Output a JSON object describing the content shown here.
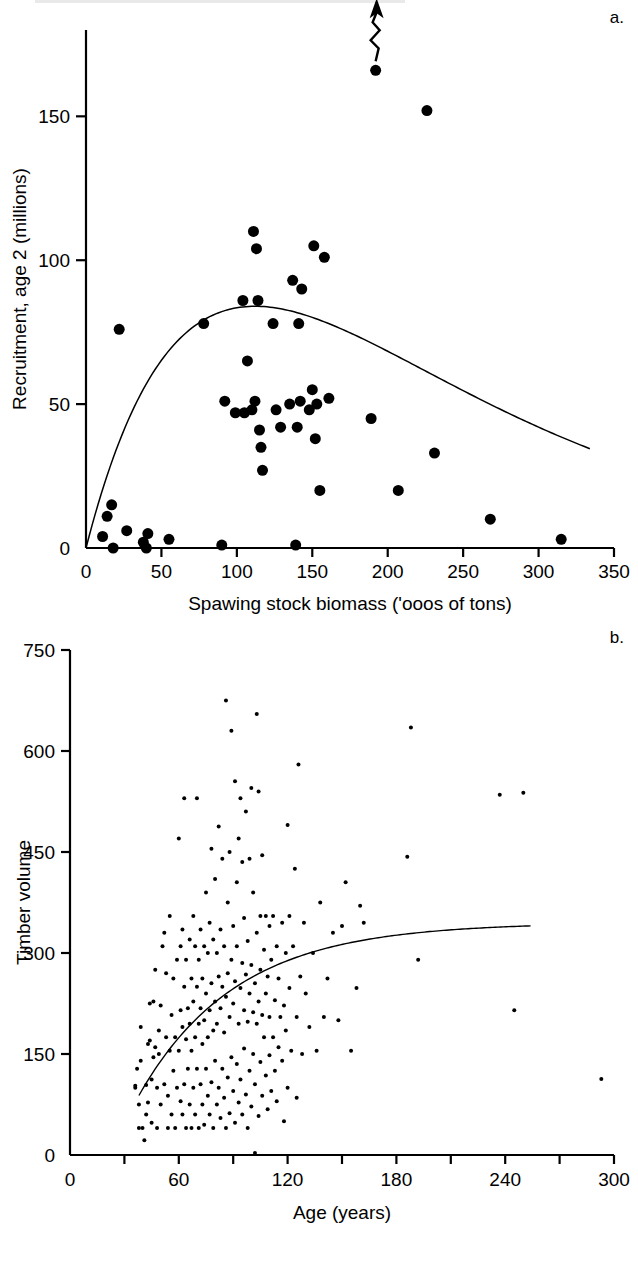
{
  "figure": {
    "width": 638,
    "height": 1271,
    "background": "#ffffff",
    "ink_color": "#000000"
  },
  "panels": [
    {
      "id": "a",
      "letter": "a."
    },
    {
      "id": "b",
      "letter": "b."
    }
  ],
  "chart_data": [
    {
      "type": "scatter",
      "panel": "a",
      "title": "",
      "xlabel": "Spawing stock biomass ('ooos of tons)",
      "ylabel": "Recruitment, age 2 (millions)",
      "xlim": [
        0,
        350
      ],
      "ylim": [
        0,
        180
      ],
      "xticks": [
        0,
        50,
        100,
        150,
        200,
        250,
        300,
        350
      ],
      "xtick_labels": [
        "0",
        "50",
        "100",
        "150",
        "200",
        "250",
        "300",
        "350"
      ],
      "yticks": [
        0,
        50,
        100,
        150
      ],
      "ytick_labels": [
        "0",
        "50",
        "100",
        "150"
      ],
      "grid": false,
      "legend": "none",
      "marker": "filled-circle",
      "marker_size_px": 11,
      "points": [
        [
          11,
          4
        ],
        [
          14,
          11
        ],
        [
          17,
          15
        ],
        [
          18,
          0
        ],
        [
          22,
          76
        ],
        [
          27,
          6
        ],
        [
          38,
          2
        ],
        [
          40,
          0
        ],
        [
          41,
          5
        ],
        [
          55,
          3
        ],
        [
          78,
          78
        ],
        [
          90,
          1
        ],
        [
          92,
          51
        ],
        [
          99,
          47
        ],
        [
          104,
          86
        ],
        [
          105,
          47
        ],
        [
          107,
          65
        ],
        [
          110,
          48
        ],
        [
          111,
          110
        ],
        [
          112,
          51
        ],
        [
          113,
          104
        ],
        [
          114,
          86
        ],
        [
          115,
          41
        ],
        [
          116,
          35
        ],
        [
          117,
          27
        ],
        [
          124,
          78
        ],
        [
          126,
          48
        ],
        [
          129,
          42
        ],
        [
          135,
          50
        ],
        [
          137,
          93
        ],
        [
          139,
          1
        ],
        [
          140,
          42
        ],
        [
          141,
          78
        ],
        [
          142,
          51
        ],
        [
          143,
          90
        ],
        [
          148,
          48
        ],
        [
          150,
          55
        ],
        [
          151,
          105
        ],
        [
          152,
          38
        ],
        [
          153,
          50
        ],
        [
          155,
          20
        ],
        [
          158,
          101
        ],
        [
          161,
          52
        ],
        [
          189,
          45
        ],
        [
          192,
          166
        ],
        [
          207,
          20
        ],
        [
          226,
          152
        ],
        [
          231,
          33
        ],
        [
          268,
          10
        ],
        [
          315,
          3
        ]
      ],
      "offscale_annotation": {
        "marker": "zigzag-arrow-up",
        "at_point": [
          192,
          166
        ],
        "meaning": "value continues above axis"
      },
      "fit_curve": {
        "name": "Ricker stock-recruitment curve",
        "style": "solid-thin",
        "x_start": 0,
        "x_end": 335,
        "peak_x": 112,
        "peak_y": 84,
        "y_at_end": 3
      }
    },
    {
      "type": "scatter",
      "panel": "b",
      "title": "",
      "xlabel": "Age (years)",
      "ylabel": "Timber volume",
      "xlim": [
        0,
        300
      ],
      "ylim": [
        0,
        750
      ],
      "xticks": [
        0,
        30,
        60,
        90,
        120,
        150,
        180,
        210,
        240,
        270,
        300
      ],
      "xtick_labels": [
        "0",
        "",
        "60",
        "",
        "120",
        "",
        "180",
        "",
        "240",
        "",
        "300"
      ],
      "yticks": [
        0,
        150,
        300,
        450,
        600,
        750
      ],
      "ytick_labels": [
        "0",
        "150",
        "300",
        "450",
        "600",
        "750"
      ],
      "grid": false,
      "legend": "none",
      "marker": "filled-circle",
      "marker_size_px": 4,
      "points": [
        [
          36,
          100
        ],
        [
          36,
          103
        ],
        [
          37,
          128
        ],
        [
          38,
          40
        ],
        [
          38,
          75
        ],
        [
          39,
          140
        ],
        [
          39,
          190
        ],
        [
          40,
          40
        ],
        [
          41,
          22
        ],
        [
          42,
          60
        ],
        [
          42,
          104
        ],
        [
          43,
          78
        ],
        [
          43,
          165
        ],
        [
          44,
          170
        ],
        [
          44,
          225
        ],
        [
          45,
          48
        ],
        [
          45,
          112
        ],
        [
          46,
          145
        ],
        [
          46,
          228
        ],
        [
          47,
          160
        ],
        [
          47,
          275
        ],
        [
          48,
          40
        ],
        [
          48,
          100
        ],
        [
          49,
          150
        ],
        [
          49,
          185
        ],
        [
          50,
          75
        ],
        [
          50,
          222
        ],
        [
          51,
          310
        ],
        [
          52,
          105
        ],
        [
          52,
          330
        ],
        [
          53,
          175
        ],
        [
          53,
          270
        ],
        [
          54,
          40
        ],
        [
          54,
          88
        ],
        [
          55,
          155
        ],
        [
          55,
          355
        ],
        [
          56,
          60
        ],
        [
          56,
          208
        ],
        [
          57,
          125
        ],
        [
          57,
          262
        ],
        [
          58,
          40
        ],
        [
          58,
          175
        ],
        [
          59,
          100
        ],
        [
          59,
          290
        ],
        [
          60,
          155
        ],
        [
          60,
          470
        ],
        [
          61,
          80
        ],
        [
          61,
          215
        ],
        [
          61,
          310
        ],
        [
          62,
          60
        ],
        [
          62,
          190
        ],
        [
          62,
          335
        ],
        [
          63,
          105
        ],
        [
          63,
          250
        ],
        [
          63,
          530
        ],
        [
          64,
          40
        ],
        [
          64,
          172
        ],
        [
          64,
          290
        ],
        [
          65,
          128
        ],
        [
          65,
          218
        ],
        [
          66,
          75
        ],
        [
          66,
          195
        ],
        [
          66,
          320
        ],
        [
          67,
          40
        ],
        [
          67,
          155
        ],
        [
          67,
          262
        ],
        [
          68,
          100
        ],
        [
          68,
          228
        ],
        [
          68,
          355
        ],
        [
          69,
          60
        ],
        [
          69,
          175
        ],
        [
          69,
          310
        ],
        [
          70,
          128
        ],
        [
          70,
          250
        ],
        [
          70,
          530
        ],
        [
          71,
          40
        ],
        [
          71,
          195
        ],
        [
          71,
          290
        ],
        [
          72,
          105
        ],
        [
          72,
          218
        ],
        [
          72,
          335
        ],
        [
          73,
          75
        ],
        [
          73,
          165
        ],
        [
          73,
          262
        ],
        [
          74,
          45
        ],
        [
          74,
          200
        ],
        [
          74,
          310
        ],
        [
          75,
          128
        ],
        [
          75,
          240
        ],
        [
          75,
          390
        ],
        [
          76,
          88
        ],
        [
          76,
          175
        ],
        [
          76,
          300
        ],
        [
          77,
          60
        ],
        [
          77,
          215
        ],
        [
          77,
          345
        ],
        [
          78,
          108
        ],
        [
          78,
          255
        ],
        [
          78,
          455
        ],
        [
          79,
          40
        ],
        [
          79,
          185
        ],
        [
          79,
          320
        ],
        [
          80,
          140
        ],
        [
          80,
          228
        ],
        [
          80,
          410
        ],
        [
          81,
          75
        ],
        [
          81,
          195
        ],
        [
          81,
          300
        ],
        [
          82,
          100
        ],
        [
          82,
          265
        ],
        [
          82,
          488
        ],
        [
          83,
          55
        ],
        [
          83,
          218
        ],
        [
          83,
          335
        ],
        [
          84,
          128
        ],
        [
          84,
          250
        ],
        [
          84,
          440
        ],
        [
          85,
          85
        ],
        [
          85,
          182
        ],
        [
          85,
          310
        ],
        [
          86,
          40
        ],
        [
          86,
          235
        ],
        [
          86,
          675
        ],
        [
          87,
          115
        ],
        [
          87,
          270
        ],
        [
          87,
          375
        ],
        [
          88,
          62
        ],
        [
          88,
          205
        ],
        [
          88,
          450
        ],
        [
          89,
          145
        ],
        [
          89,
          290
        ],
        [
          89,
          630
        ],
        [
          90,
          95
        ],
        [
          90,
          225
        ],
        [
          90,
          340
        ],
        [
          91,
          48
        ],
        [
          91,
          258
        ],
        [
          91,
          555
        ],
        [
          92,
          135
        ],
        [
          92,
          310
        ],
        [
          92,
          405
        ],
        [
          93,
          78
        ],
        [
          93,
          195
        ],
        [
          93,
          470
        ],
        [
          94,
          112
        ],
        [
          94,
          248
        ],
        [
          94,
          530
        ],
        [
          95,
          60
        ],
        [
          95,
          285
        ],
        [
          95,
          435
        ],
        [
          96,
          158
        ],
        [
          96,
          215
        ],
        [
          96,
          352
        ],
        [
          97,
          90
        ],
        [
          97,
          268
        ],
        [
          97,
          510
        ],
        [
          98,
          40
        ],
        [
          98,
          198
        ],
        [
          98,
          318
        ],
        [
          99,
          125
        ],
        [
          99,
          240
        ],
        [
          99,
          440
        ],
        [
          100,
          72
        ],
        [
          100,
          282
        ],
        [
          100,
          545
        ],
        [
          101,
          150
        ],
        [
          101,
          212
        ],
        [
          101,
          390
        ],
        [
          102,
          3
        ],
        [
          102,
          105
        ],
        [
          102,
          255
        ],
        [
          103,
          195
        ],
        [
          103,
          330
        ],
        [
          103,
          655
        ],
        [
          104,
          58
        ],
        [
          104,
          228
        ],
        [
          104,
          540
        ],
        [
          105,
          138
        ],
        [
          105,
          275
        ],
        [
          105,
          355
        ],
        [
          106,
          88
        ],
        [
          106,
          208
        ],
        [
          106,
          445
        ],
        [
          107,
          175
        ],
        [
          107,
          305
        ],
        [
          108,
          118
        ],
        [
          108,
          240
        ],
        [
          108,
          355
        ],
        [
          109,
          68
        ],
        [
          109,
          265
        ],
        [
          110,
          148
        ],
        [
          110,
          205
        ],
        [
          110,
          340
        ],
        [
          111,
          95
        ],
        [
          111,
          290
        ],
        [
          112,
          175
        ],
        [
          112,
          355
        ],
        [
          113,
          125
        ],
        [
          113,
          230
        ],
        [
          114,
          80
        ],
        [
          114,
          310
        ],
        [
          115,
          160
        ],
        [
          115,
          262
        ],
        [
          116,
          205
        ],
        [
          117,
          140
        ],
        [
          117,
          345
        ],
        [
          118,
          50
        ],
        [
          118,
          222
        ],
        [
          119,
          185
        ],
        [
          119,
          300
        ],
        [
          120,
          100
        ],
        [
          120,
          490
        ],
        [
          121,
          248
        ],
        [
          121,
          355
        ],
        [
          122,
          155
        ],
        [
          123,
          310
        ],
        [
          124,
          425
        ],
        [
          125,
          85
        ],
        [
          125,
          205
        ],
        [
          126,
          580
        ],
        [
          127,
          265
        ],
        [
          128,
          150
        ],
        [
          129,
          345
        ],
        [
          130,
          240
        ],
        [
          132,
          190
        ],
        [
          134,
          300
        ],
        [
          136,
          155
        ],
        [
          138,
          375
        ],
        [
          140,
          205
        ],
        [
          142,
          262
        ],
        [
          145,
          330
        ],
        [
          148,
          200
        ],
        [
          150,
          340
        ],
        [
          152,
          405
        ],
        [
          155,
          155
        ],
        [
          158,
          248
        ],
        [
          160,
          370
        ],
        [
          162,
          345
        ],
        [
          186,
          443
        ],
        [
          188,
          635
        ],
        [
          192,
          290
        ],
        [
          237,
          535
        ],
        [
          245,
          215
        ],
        [
          250,
          538
        ],
        [
          293,
          113
        ]
      ],
      "fit_curve": {
        "name": "asymptotic growth curve",
        "style": "solid-thin",
        "x_start": 38,
        "x_end": 255,
        "y_start": 110,
        "asymptote_y": 345
      }
    }
  ]
}
